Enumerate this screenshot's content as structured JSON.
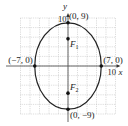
{
  "chart_data": {
    "type": "line",
    "title": "",
    "xlabel": "x",
    "ylabel": "y",
    "xlim": [
      -10,
      10
    ],
    "ylim": [
      -10,
      10
    ],
    "grid": true,
    "grid_step": 2,
    "x_tick_labels": [
      {
        "value": 10,
        "label": "10"
      }
    ],
    "y_tick_labels": [
      {
        "value": 10,
        "label": "10"
      }
    ],
    "curve": {
      "name": "ellipse",
      "equation": "x^2/49 + y^2/81 = 1",
      "center": [
        0,
        0
      ],
      "semi_x": 7,
      "semi_y": 9
    },
    "points": [
      {
        "name": "vertex-top",
        "x": 0,
        "y": 9,
        "label": "(0, 9)",
        "anchor": "right-above"
      },
      {
        "name": "vertex-bottom",
        "x": 0,
        "y": -9,
        "label": "(0, −9)",
        "anchor": "right-below"
      },
      {
        "name": "covertex-left",
        "x": -7,
        "y": 0,
        "label": "(−7, 0)",
        "anchor": "left-above"
      },
      {
        "name": "covertex-right",
        "x": 7,
        "y": 0,
        "label": "(7, 0)",
        "anchor": "right-above"
      },
      {
        "name": "focus-1",
        "x": 0,
        "y": 5.66,
        "label": "F",
        "sub": "1",
        "anchor": "right-below"
      },
      {
        "name": "focus-2",
        "x": 0,
        "y": -5.66,
        "label": "F",
        "sub": "2",
        "anchor": "right-above"
      }
    ]
  }
}
